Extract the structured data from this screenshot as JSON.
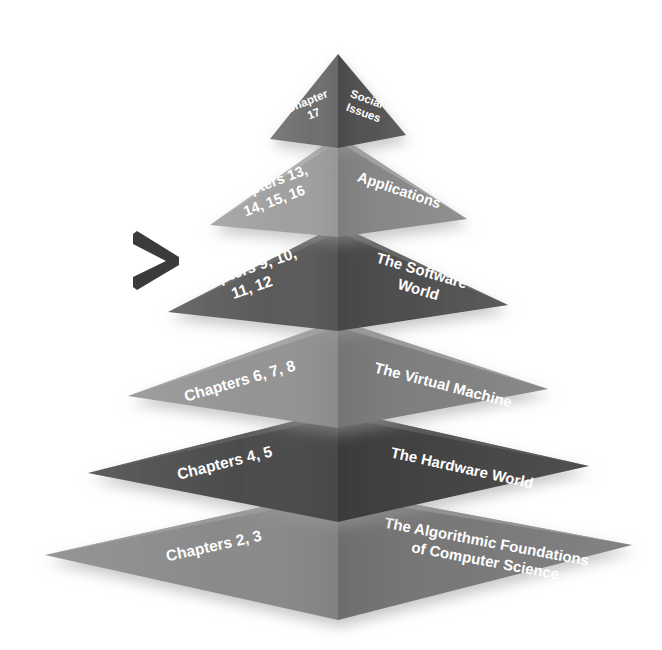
{
  "diagram": {
    "type": "layered-pyramid",
    "background_color": "#ffffff",
    "label_color": "#ffffff",
    "marker": {
      "name": "chevron-right-marker",
      "glyph": ">",
      "points_to_level": 4,
      "color": "#3b3b3b"
    },
    "levels": [
      {
        "index": 1,
        "position": "top",
        "left_face_label": "Chapter\n17",
        "left_face_lines": [
          "Chapter",
          "17"
        ],
        "right_face_label": "Social Issues",
        "right_face_lines": [
          "Social",
          "Issues"
        ],
        "left_face_color": "#6e6e6e",
        "right_face_color": "#4e4e4e"
      },
      {
        "index": 2,
        "position": "second",
        "left_face_label": "Chapters 13, 14, 15, 16",
        "left_face_lines": [
          "Chapters 13,",
          "14, 15, 16"
        ],
        "right_face_label": "Applications",
        "right_face_lines": [
          "Applications"
        ],
        "left_face_color": "#a0a0a0",
        "right_face_color": "#858585"
      },
      {
        "index": 3,
        "position": "third",
        "left_face_label": "Chapters 9, 10, 11, 12",
        "left_face_lines": [
          "Chapters 9, 10,",
          "11, 12"
        ],
        "right_face_label": "The Software World",
        "right_face_lines": [
          "The Software",
          "World"
        ],
        "left_face_color": "#5a5a5a",
        "right_face_color": "#4a4a4a"
      },
      {
        "index": 4,
        "position": "fourth",
        "left_face_label": "Chapters 6, 7, 8",
        "left_face_lines": [
          "Chapters 6, 7, 8"
        ],
        "right_face_label": "The Virtual Machine",
        "right_face_lines": [
          "The Virtual Machine"
        ],
        "left_face_color": "#949494",
        "right_face_color": "#7c7c7c"
      },
      {
        "index": 5,
        "position": "fifth",
        "left_face_label": "Chapters 4, 5",
        "left_face_lines": [
          "Chapters 4, 5"
        ],
        "right_face_label": "The Hardware World",
        "right_face_lines": [
          "The Hardware World"
        ],
        "left_face_color": "#4c4c4c",
        "right_face_color": "#3e3e3e"
      },
      {
        "index": 6,
        "position": "base",
        "left_face_label": "Chapters 2, 3",
        "left_face_lines": [
          "Chapters 2, 3"
        ],
        "right_face_label": "The Algorithmic Foundations of Computer Science",
        "right_face_lines": [
          "The Algorithmic Foundations",
          "of Computer Science"
        ],
        "left_face_color": "#8a8a8a",
        "right_face_color": "#757575"
      }
    ]
  }
}
